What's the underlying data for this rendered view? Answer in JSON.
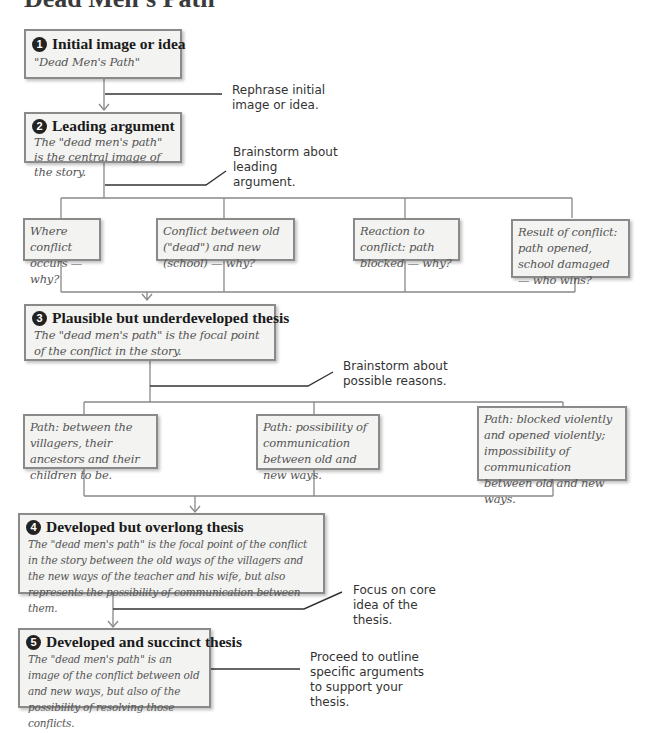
{
  "title": "Dead Men's Path",
  "stages": [
    {
      "number": "1",
      "heading": "Initial image or idea",
      "text": "\"Dead Men's Path\"",
      "callout": "Rephrase initial image or idea."
    },
    {
      "number": "2",
      "heading": "Leading argument",
      "text": "The \"dead men's path\" is the central image of the story.",
      "callout": "Brainstorm about leading argument."
    },
    {
      "number": "3",
      "heading": "Plausible but underdeveloped thesis",
      "text": "The \"dead men's path\" is the focal point of the conflict in the story.",
      "callout": "Brainstorm about possible reasons."
    },
    {
      "number": "4",
      "heading": "Developed but overlong thesis",
      "text": "The \"dead men's path\" is the focal point of the conflict in the story between the old ways of the villagers and the new ways of the teacher and his wife, but also represents the possibility of communication between them.",
      "callout": "Focus on core idea of the thesis."
    },
    {
      "number": "5",
      "heading": "Developed and succinct thesis",
      "text": "The \"dead men's path\" is an image of the conflict between old and new ways, but also of the possibility of resolving those conflicts.",
      "callout": "Proceed to outline specific arguments to support your thesis."
    }
  ],
  "brainstorm_argument": [
    "Where conflict occurs — why?",
    "Conflict between old (\"dead\") and new (school) — why?",
    "Reaction to conflict: path blocked — why?",
    "Result of conflict: path opened, school damaged — who wins?"
  ],
  "brainstorm_reasons": [
    "Path: between the villagers, their ancestors and their children to be.",
    "Path: possibility of communication between old and new ways.",
    "Path: blocked violently and opened violently; impossibility of communication between old and new ways."
  ],
  "colors": {
    "box_fill": "#f3f3f1",
    "box_border": "#8a8a8a",
    "connector": "#888888",
    "callout_line": "#333333"
  }
}
